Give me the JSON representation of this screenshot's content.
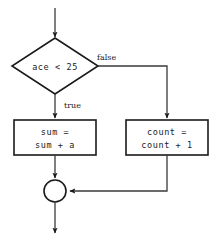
{
  "diagram": {
    "type": "flowchart",
    "title": "",
    "background_color": "#ffffff",
    "stroke_color": "#1a1a1a",
    "connector_color": "#3a3a3a",
    "nodes": {
      "decision": {
        "shape": "diamond",
        "text": "ace < 25"
      },
      "process_true": {
        "shape": "rectangle",
        "line1": "sum =",
        "line2": "sum + a"
      },
      "process_false": {
        "shape": "rectangle",
        "line1": "count =",
        "line2": "count + 1"
      },
      "merge": {
        "shape": "circle",
        "text": ""
      }
    },
    "edge_labels": {
      "true_branch": "true",
      "false_branch": "false"
    }
  }
}
